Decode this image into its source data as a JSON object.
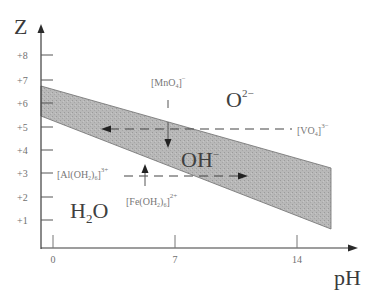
{
  "diagram": {
    "y_axis": {
      "label": "Z",
      "ticks": [
        "+8",
        "+7",
        "+6",
        "+5",
        "+4",
        "+3",
        "+2",
        "+1"
      ]
    },
    "x_axis": {
      "label": "pH",
      "ticks": [
        "0",
        "7",
        "14"
      ]
    },
    "regions": {
      "oxide": {
        "base": "O",
        "charge": "2−"
      },
      "hydroxide": {
        "base": "OH",
        "charge": "−"
      },
      "aqua": {
        "base": "H",
        "sub": "2",
        "tail": "O"
      }
    },
    "species": {
      "permanganate": {
        "base": "[MnO",
        "sub": "4",
        "close": "]",
        "charge": "−"
      },
      "vanadate": {
        "base": "[VO",
        "sub": "4",
        "close": "]",
        "charge": "3−"
      },
      "aluminium_aqua": {
        "base": "[Al(OH",
        "sub1": "2",
        "mid": ")",
        "sub2": "6",
        "close": "]",
        "charge": "3+"
      },
      "iron_aqua": {
        "base": "[Fe(OH",
        "sub1": "2",
        "mid": ")",
        "sub2": "6",
        "close": "]",
        "charge": "2+"
      }
    },
    "colors": {
      "band_fill": "#b4b4b4",
      "axis": "#3c3c3c",
      "text": "#777777"
    }
  }
}
